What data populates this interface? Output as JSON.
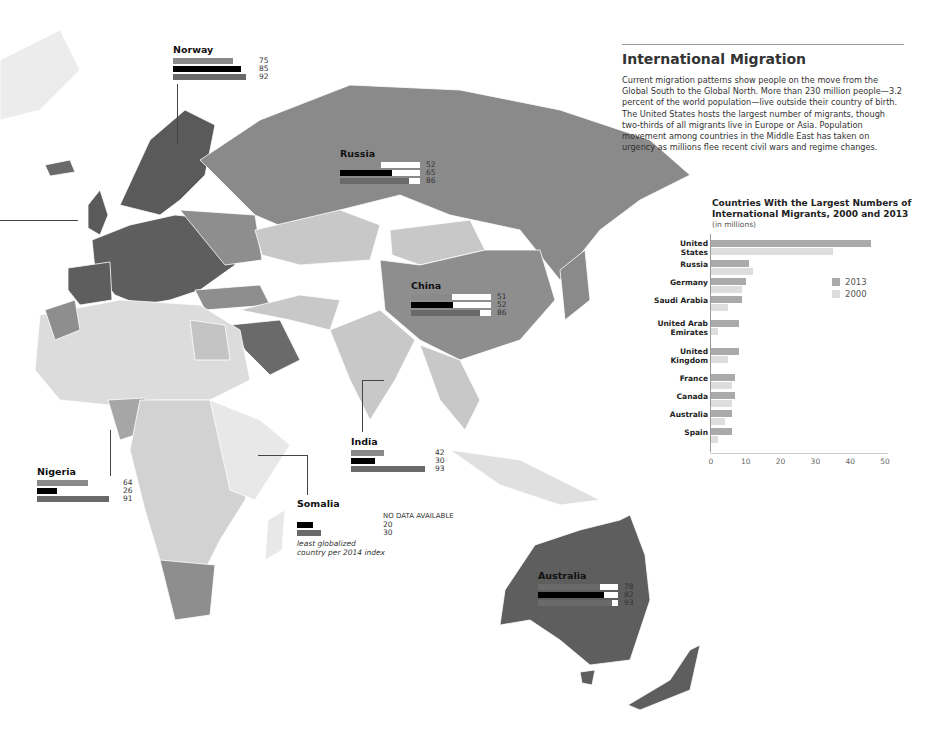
{
  "panel": {
    "title": "International Migration",
    "body": "Current migration patterns show people on the move from the Global South to the Global North. More than 230 million people—3.2 percent of the world population—live outside their country of birth. The United States hosts the largest number of migrants, though two-thirds of all migrants live in Europe or Asia. Population movement among countries in the Middle East has taken on urgency as millions flee recent civil wars and regime changes."
  },
  "colors": {
    "dark_region": "#5e5e5e",
    "mid_region": "#8e8e8e",
    "light_region": "#c8c8c8",
    "pale_region": "#e2e2e2",
    "bar_2013": "#aaaaaa",
    "bar_2000": "#dddddd",
    "callout_bar_1": "#8a8a8a",
    "callout_bar_2": "#000000",
    "callout_bar_3": "#6a6a6a"
  },
  "callouts": [
    {
      "name": "Norway",
      "values": [
        "75",
        "85",
        "92"
      ],
      "track": false
    },
    {
      "name": "Russia",
      "values": [
        "52",
        "65",
        "86"
      ],
      "track": true
    },
    {
      "name": "China",
      "values": [
        "51",
        "52",
        "86"
      ],
      "track": true
    },
    {
      "name": "India",
      "values": [
        "42",
        "30",
        "93"
      ],
      "track": false
    },
    {
      "name": "Nigeria",
      "values": [
        "64",
        "26",
        "91"
      ],
      "track": false
    },
    {
      "name": "Somalia",
      "values": [
        "NO DATA AVAILABLE",
        "20",
        "30"
      ],
      "track": false,
      "note_1": "least globalized",
      "note_2": "country per 2014 index"
    },
    {
      "name": "Australia",
      "values": [
        "78",
        "82",
        "93"
      ],
      "track": true
    }
  ],
  "chart_data": {
    "type": "bar",
    "orientation": "horizontal",
    "title": "Countries With the Largest Numbers of International Migrants, 2000 and 2013",
    "subtitle": "(in millions)",
    "xlabel": "",
    "ylabel": "",
    "xlim": [
      0,
      50
    ],
    "xticks": [
      "0",
      "10",
      "20",
      "30",
      "40",
      "50"
    ],
    "grid": false,
    "legend_position": "right",
    "categories": [
      "United States",
      "Russia",
      "Germany",
      "Saudi Arabia",
      "United Arab Emirates",
      "United Kingdom",
      "France",
      "Canada",
      "Australia",
      "Spain"
    ],
    "series": [
      {
        "name": "2013",
        "color": "#aaaaaa",
        "values": [
          46,
          11,
          10,
          9,
          8,
          8,
          7,
          7,
          6,
          6
        ]
      },
      {
        "name": "2000",
        "color": "#dddddd",
        "values": [
          35,
          12,
          9,
          5,
          2,
          5,
          6,
          6,
          4,
          2
        ]
      }
    ],
    "label_lines": [
      [
        "United",
        "States"
      ],
      [
        "Russia"
      ],
      [
        "Germany"
      ],
      [
        "Saudi Arabia"
      ],
      [
        "United Arab",
        "Emirates"
      ],
      [
        "United",
        "Kingdom"
      ],
      [
        "France"
      ],
      [
        "Canada"
      ],
      [
        "Australia"
      ],
      [
        "Spain"
      ]
    ]
  }
}
